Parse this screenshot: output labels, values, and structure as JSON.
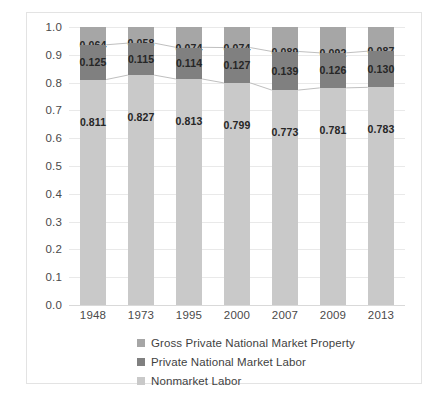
{
  "chart_data": {
    "type": "bar",
    "subtype": "stacked-100-percent",
    "title": "",
    "xlabel": "",
    "ylabel": "",
    "ylim": [
      0.0,
      1.0
    ],
    "ytick_step": 0.1,
    "grid": true,
    "legend_position": "bottom",
    "categories": [
      "1948",
      "1973",
      "1995",
      "2000",
      "2007",
      "2009",
      "2013"
    ],
    "series": [
      {
        "name": "Gross Private National Market Property",
        "color": "#a6a6a6",
        "values": [
          0.064,
          0.058,
          0.074,
          0.074,
          0.089,
          0.092,
          0.087
        ],
        "labels": [
          "0.064",
          "0.058",
          "0.074",
          "0.074",
          "0.089",
          "0.092",
          "0.087"
        ]
      },
      {
        "name": "Private National Market Labor",
        "color": "#808080",
        "values": [
          0.125,
          0.115,
          0.114,
          0.127,
          0.139,
          0.126,
          0.13
        ],
        "labels": [
          "0.125",
          "0.115",
          "0.114",
          "0.127",
          "0.139",
          "0.126",
          "0.130"
        ]
      },
      {
        "name": "Nonmarket Labor",
        "color": "#c9c9c9",
        "values": [
          0.811,
          0.827,
          0.813,
          0.799,
          0.773,
          0.781,
          0.783
        ],
        "labels": [
          "0.811",
          "0.827",
          "0.813",
          "0.799",
          "0.773",
          "0.781",
          "0.783"
        ]
      }
    ],
    "ytick_labels": [
      "1.0",
      "0.9",
      "0.8",
      "0.7",
      "0.6",
      "0.5",
      "0.4",
      "0.3",
      "0.2",
      "0.1",
      "0.0"
    ],
    "stack_order_bottom_to_top": [
      "Nonmarket Labor",
      "Private National Market Labor",
      "Gross Private National Market Property"
    ]
  },
  "legend": {
    "items": [
      {
        "label": "Gross Private National Market Property",
        "color": "#a6a6a6"
      },
      {
        "label": "Private National Market Labor",
        "color": "#808080"
      },
      {
        "label": "Nonmarket Labor",
        "color": "#c9c9c9"
      }
    ]
  }
}
